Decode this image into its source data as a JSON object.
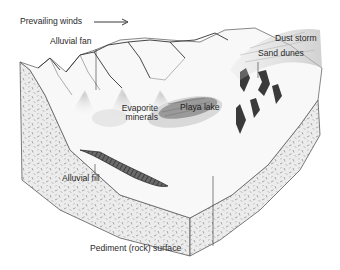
{
  "diagram": {
    "type": "block-diagram",
    "labels": {
      "prevailing_winds": "Prevailing winds",
      "alluvial_fan": "Alluvial fan",
      "evaporite_minerals_line1": "Evaporite",
      "evaporite_minerals_line2": "minerals",
      "playa_lake": "Playa lake",
      "dust_storm": "Dust storm",
      "sand_dunes": "Sand dunes",
      "alluvial_fill": "Alluvial fill",
      "pediment_surface": "Pediment (rock) surface"
    },
    "arrow": {
      "direction": "right",
      "meaning": "wind-direction"
    },
    "colors": {
      "ink": "#2a2a2a",
      "rock_fill": "#e6e6e6",
      "surface_fill": "#f7f7f7",
      "playa_fill": "#9a9a9a",
      "dune_fill": "#3a3a3a",
      "background": "#ffffff"
    }
  }
}
